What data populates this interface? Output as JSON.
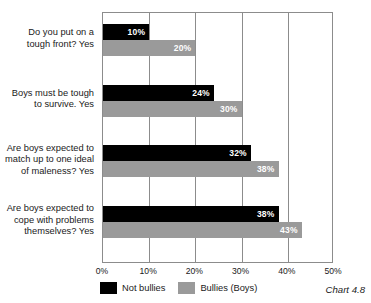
{
  "chart_data": {
    "type": "bar",
    "orientation": "horizontal",
    "title": "",
    "subtitle": "",
    "caption": "Chart 4.8",
    "xlabel": "",
    "ylabel": "",
    "xlim": [
      0,
      50
    ],
    "xticks": [
      0,
      10,
      20,
      30,
      40,
      50
    ],
    "xtick_labels": [
      "0%",
      "10%",
      "20%",
      "30%",
      "40%",
      "50%"
    ],
    "grid": true,
    "legend_position": "bottom-left",
    "categories": [
      "Do you put on a\ntough front? Yes",
      "Boys must be tough\nto survive. Yes",
      "Are boys expected to\nmatch up to one ideal\nof maleness? Yes",
      "Are boys expected to\ncope with problems\nthemselves? Yes"
    ],
    "series": [
      {
        "name": "Not bullies",
        "color": "#000000",
        "values": [
          10,
          24,
          32,
          38
        ],
        "labels": [
          "10%",
          "24%",
          "32%",
          "38%"
        ]
      },
      {
        "name": "Bullies (Boys)",
        "color": "#9a9a9a",
        "values": [
          20,
          30,
          38,
          43
        ],
        "labels": [
          "20%",
          "30%",
          "38%",
          "43%"
        ]
      }
    ]
  },
  "legend": {
    "items": [
      {
        "label": "Not bullies",
        "color": "#000000"
      },
      {
        "label": "Bullies (Boys)",
        "color": "#9a9a9a"
      }
    ]
  },
  "caption": "Chart 4.8",
  "colors": {
    "not_bullies": "#000000",
    "bullies_boys": "#9a9a9a",
    "axis": "#8c8c8c",
    "text": "#1a1a1a",
    "background": "#ffffff"
  }
}
